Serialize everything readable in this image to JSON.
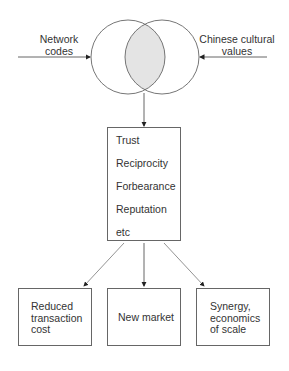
{
  "diagram": {
    "inputs": {
      "left_label_line1": "Network",
      "left_label_line2": "codes",
      "right_label_line1": "Chinese cultural",
      "right_label_line2": "values"
    },
    "center_box": {
      "items": [
        "Trust",
        "Reciprocity",
        "Forbearance",
        "Reputation",
        "etc"
      ]
    },
    "outcomes": [
      {
        "lines": [
          "Reduced",
          "transaction",
          "cost"
        ]
      },
      {
        "lines": [
          "New market"
        ]
      },
      {
        "lines": [
          "Synergy,",
          "economics",
          "of scale"
        ]
      }
    ],
    "colors": {
      "line": "#555555",
      "overlap_fill": "#e4e4e4"
    }
  }
}
